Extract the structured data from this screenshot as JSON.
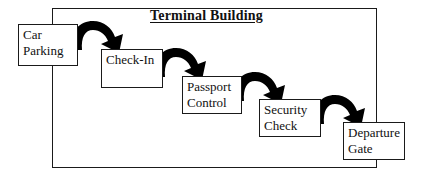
{
  "diagram": {
    "title": "Terminal Building",
    "container_label": "terminal-building-frame",
    "frame": {
      "x": 52,
      "y": 8,
      "width": 325,
      "height": 160
    },
    "title_pos": {
      "x": 150,
      "y": 8
    },
    "boxes": [
      {
        "id": "car-parking",
        "lines": [
          "Car",
          "Parking"
        ],
        "line1": "Car",
        "line2": "Parking",
        "x": 18,
        "y": 24,
        "width": 60,
        "height": 42
      },
      {
        "id": "check-in",
        "lines": [
          "Check-In"
        ],
        "line1": "Check-In",
        "line2": "",
        "x": 101,
        "y": 49,
        "width": 62,
        "height": 39
      },
      {
        "id": "passport-control",
        "lines": [
          "Passport",
          "Control"
        ],
        "line1": "Passport",
        "line2": "Control",
        "x": 182,
        "y": 76,
        "width": 60,
        "height": 38
      },
      {
        "id": "security-check",
        "lines": [
          "Security",
          "Check"
        ],
        "line1": "Security",
        "line2": "Check",
        "x": 259,
        "y": 99,
        "width": 62,
        "height": 38
      },
      {
        "id": "departure-gate",
        "lines": [
          "Departure",
          "Gate"
        ],
        "line1": "Departure",
        "line2": "Gate",
        "x": 343,
        "y": 122,
        "width": 62,
        "height": 38
      }
    ],
    "arrows": [
      {
        "id": "arrow-car-parking-to-check-in",
        "from": "car-parking",
        "to": "check-in"
      },
      {
        "id": "arrow-check-in-to-passport-control",
        "from": "check-in",
        "to": "passport-control"
      },
      {
        "id": "arrow-passport-control-to-security-check",
        "from": "passport-control",
        "to": "security-check"
      },
      {
        "id": "arrow-security-check-to-departure-gate",
        "from": "security-check",
        "to": "departure-gate"
      }
    ],
    "colors": {
      "stroke": "#1a1a1a",
      "arrow_fill": "#000000",
      "background": "#ffffff",
      "text": "#111111"
    }
  }
}
